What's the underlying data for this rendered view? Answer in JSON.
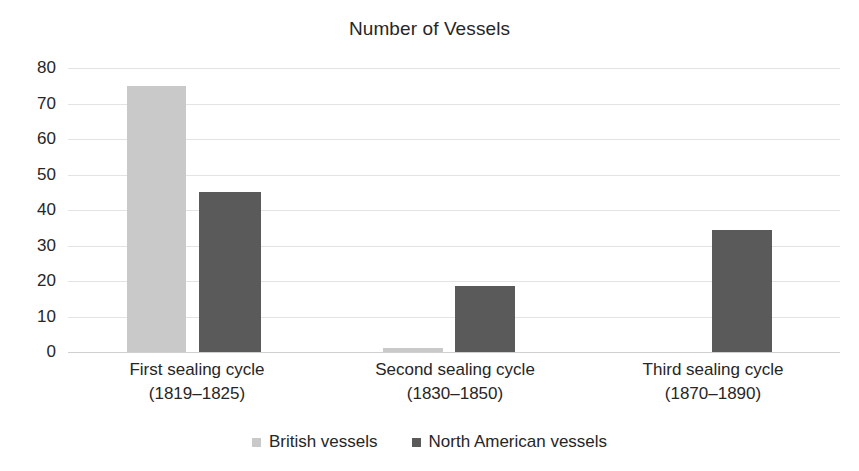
{
  "chart_data": {
    "type": "bar",
    "title": "Number of Vessels",
    "xlabel": "",
    "ylabel": "",
    "ylim": [
      0,
      80
    ],
    "yticks": [
      80,
      70,
      60,
      50,
      40,
      30,
      20,
      10,
      0
    ],
    "grid": true,
    "legend_position": "bottom",
    "categories": [
      {
        "line1": "First sealing cycle",
        "line2": "(1819–1825)"
      },
      {
        "line1": "Second sealing cycle",
        "line2": "(1830–1850)"
      },
      {
        "line1": "Third sealing cycle",
        "line2": "(1870–1890)"
      }
    ],
    "series": [
      {
        "name": "British vessels",
        "color": "#c9c9c9",
        "values": [
          75,
          1,
          0
        ]
      },
      {
        "name": "North American vessels",
        "color": "#5a5a5a",
        "values": [
          45,
          18.5,
          34.5
        ]
      }
    ]
  },
  "legend": {
    "items": [
      {
        "label": "British vessels",
        "swatch": "light-gray-square"
      },
      {
        "label": "North American vessels",
        "swatch": "dark-gray-square"
      }
    ]
  }
}
